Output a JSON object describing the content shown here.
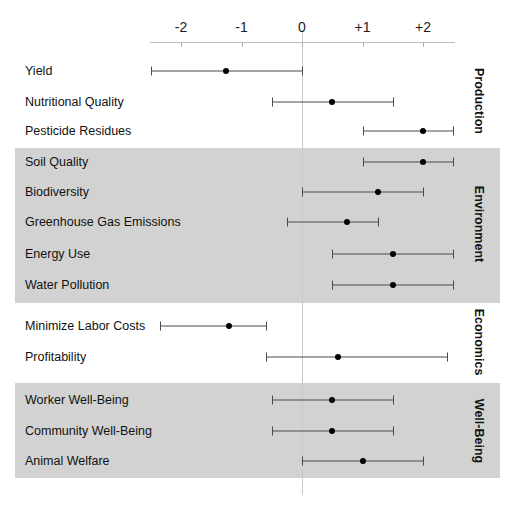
{
  "chart_data": {
    "type": "scatter",
    "subtype": "forest-plot",
    "title": "",
    "xlabel": "",
    "ylabel": "",
    "xlim": [
      -2.75,
      2.75
    ],
    "axis_ticks": [
      {
        "label": "-2",
        "value": -2
      },
      {
        "label": "-1",
        "value": -1
      },
      {
        "label": "0",
        "value": 0
      },
      {
        "label": "+1",
        "value": 1
      },
      {
        "label": "+2",
        "value": 2
      }
    ],
    "grid": false,
    "legend": "none",
    "zero_reference_line": true,
    "groups": [
      {
        "name": "Production",
        "shaded": false,
        "rows": [
          {
            "label": "Yield",
            "estimate": -1.25,
            "low": -2.5,
            "high": 0.0
          },
          {
            "label": "Nutritional Quality",
            "estimate": 0.5,
            "low": -0.5,
            "high": 1.5
          },
          {
            "label": "Pesticide Residues",
            "estimate": 2.0,
            "low": 1.0,
            "high": 2.5
          }
        ]
      },
      {
        "name": "Environment",
        "shaded": true,
        "rows": [
          {
            "label": "Soil Quality",
            "estimate": 2.0,
            "low": 1.0,
            "high": 2.5
          },
          {
            "label": "Biodiversity",
            "estimate": 1.25,
            "low": 0.0,
            "high": 2.0
          },
          {
            "label": "Greenhouse Gas Emissions",
            "estimate": 0.75,
            "low": -0.25,
            "high": 1.25
          },
          {
            "label": "Energy Use",
            "estimate": 1.5,
            "low": 0.5,
            "high": 2.5
          },
          {
            "label": "Water Pollution",
            "estimate": 1.5,
            "low": 0.5,
            "high": 2.5
          }
        ]
      },
      {
        "name": "Economics",
        "shaded": false,
        "rows": [
          {
            "label": "Minimize Labor Costs",
            "estimate": -1.2,
            "low": -2.35,
            "high": -0.6
          },
          {
            "label": "Profitability",
            "estimate": 0.6,
            "low": -0.6,
            "high": 2.4
          }
        ]
      },
      {
        "name": "Well-Being",
        "shaded": true,
        "rows": [
          {
            "label": "Worker Well-Being",
            "estimate": 0.5,
            "low": -0.5,
            "high": 1.5
          },
          {
            "label": "Community Well-Being",
            "estimate": 0.5,
            "low": -0.5,
            "high": 1.5
          },
          {
            "label": "Animal Welfare",
            "estimate": 1.0,
            "low": 0.0,
            "high": 2.0
          }
        ]
      }
    ]
  },
  "colors": {
    "band": "#d2d2d2",
    "marker": "#000000",
    "interval": "#4a4a4a",
    "axis": "#bdbdbd",
    "zero_line": "#c9c9c9",
    "background": "#ffffff",
    "text": "#111111"
  },
  "layout": {
    "x_zero_px": 302,
    "px_per_unit": 60.5,
    "axis_y_px": 42,
    "band_left_px": 15,
    "band_width_px": 485,
    "group_label_x_px": 472,
    "rows": [
      {
        "y": 71
      },
      {
        "y": 102
      },
      {
        "y": 131
      },
      {
        "y": 162
      },
      {
        "y": 192
      },
      {
        "y": 222
      },
      {
        "y": 254
      },
      {
        "y": 285
      },
      {
        "y": 326
      },
      {
        "y": 357
      },
      {
        "y": 400
      },
      {
        "y": 431
      },
      {
        "y": 461
      }
    ],
    "bands": [
      {
        "top": 148,
        "height": 155
      },
      {
        "top": 383,
        "height": 95
      }
    ]
  }
}
